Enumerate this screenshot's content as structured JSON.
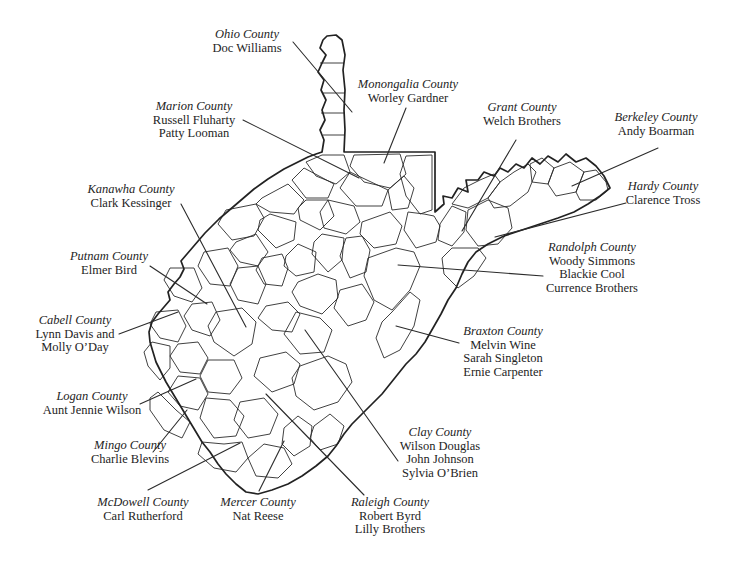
{
  "colors": {
    "ink": "#242424",
    "background": "#ffffff"
  },
  "labels": [
    {
      "county": "Ohio County",
      "artists": [
        "Doc Williams"
      ]
    },
    {
      "county": "Monongalia County",
      "artists": [
        "Worley Gardner"
      ]
    },
    {
      "county": "Marion County",
      "artists": [
        "Russell Fluharty",
        "Patty Looman"
      ]
    },
    {
      "county": "Grant County",
      "artists": [
        "Welch Brothers"
      ]
    },
    {
      "county": "Berkeley County",
      "artists": [
        "Andy Boarman"
      ]
    },
    {
      "county": "Hardy County",
      "artists": [
        "Clarence Tross"
      ]
    },
    {
      "county": "Kanawha County",
      "artists": [
        "Clark Kessinger"
      ]
    },
    {
      "county": "Putnam County",
      "artists": [
        "Elmer Bird"
      ]
    },
    {
      "county": "Cabell County",
      "artists": [
        "Lynn Davis and",
        "Molly O’Day"
      ]
    },
    {
      "county": "Randolph County",
      "artists": [
        "Woody Simmons",
        "Blackie Cool",
        "Currence Brothers"
      ]
    },
    {
      "county": "Braxton County",
      "artists": [
        "Melvin Wine",
        "Sarah Singleton",
        "Ernie Carpenter"
      ]
    },
    {
      "county": "Logan County",
      "artists": [
        "Aunt Jennie Wilson"
      ]
    },
    {
      "county": "Mingo County",
      "artists": [
        "Charlie Blevins"
      ]
    },
    {
      "county": "Clay County",
      "artists": [
        "Wilson Douglas",
        "John Johnson",
        "Sylvia O’Brien"
      ]
    },
    {
      "county": "McDowell County",
      "artists": [
        "Carl Rutherford"
      ]
    },
    {
      "county": "Mercer County",
      "artists": [
        "Nat Reese"
      ]
    },
    {
      "county": "Raleigh County",
      "artists": [
        "Robert Byrd",
        "Lilly Brothers"
      ]
    }
  ]
}
